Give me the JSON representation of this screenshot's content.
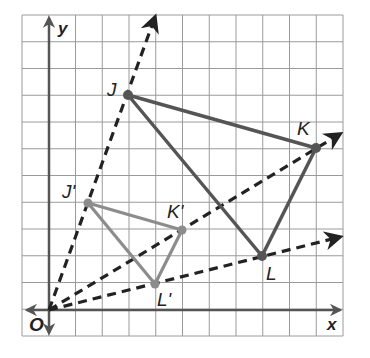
{
  "figure": {
    "type": "dilation-on-coordinate-grid",
    "grid": {
      "columns": 12,
      "rows": 12,
      "origin_col": 1,
      "origin_row": 1
    },
    "axes": {
      "x_label": "x",
      "y_label": "y",
      "origin_label": "O"
    },
    "colors": {
      "grid": "#9a9a9a",
      "axis": "#555555",
      "original": "#555555",
      "image": "#8c8c8c",
      "rays": "#222222"
    },
    "original_triangle": {
      "points": [
        {
          "label": "J",
          "x": 3,
          "y": 8
        },
        {
          "label": "K",
          "x": 10,
          "y": 6
        },
        {
          "label": "L",
          "x": 8,
          "y": 2
        }
      ]
    },
    "image_triangle": {
      "points": [
        {
          "label": "J'",
          "x": 1.5,
          "y": 4
        },
        {
          "label": "K'",
          "x": 5,
          "y": 3
        },
        {
          "label": "L'",
          "x": 4,
          "y": 1
        }
      ]
    },
    "rays": [
      "O through J",
      "O through K",
      "O through L"
    ]
  }
}
